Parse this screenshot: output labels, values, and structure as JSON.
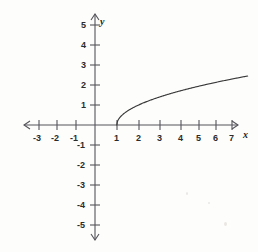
{
  "figure": {
    "kind": "cartesian-graph",
    "background_color": "#fdfdfc",
    "axis_color": "#54545a",
    "curve_color": "#3a3a3a",
    "label_color": "#2b2b2b",
    "x_axis_name": "x",
    "y_axis_name": "y"
  },
  "axes": {
    "x_tick_labels": [
      "-3",
      "-2",
      "-1",
      "1",
      "2",
      "3",
      "4",
      "5",
      "6",
      "7"
    ],
    "y_tick_labels": [
      "5",
      "4",
      "3",
      "2",
      "1",
      "-1",
      "-2",
      "-3",
      "-4",
      "-5"
    ]
  },
  "chart_data": {
    "type": "line",
    "title": "",
    "xlabel": "x",
    "ylabel": "y",
    "xlim": [
      -3.6,
      7.6
    ],
    "ylim": [
      -5.6,
      5.6
    ],
    "xticks": [
      -3,
      -2,
      -1,
      1,
      2,
      3,
      4,
      5,
      6,
      7
    ],
    "yticks": [
      5,
      4,
      3,
      2,
      1,
      -1,
      -2,
      -3,
      -4,
      -5
    ],
    "grid": false,
    "legend": null,
    "series": [
      {
        "name": "y = sqrt(x - 1)",
        "equation": "y = √(x − 1)",
        "domain": [
          1,
          7
        ],
        "x": [
          1,
          1.25,
          1.5,
          1.75,
          2,
          2.5,
          3,
          3.5,
          4,
          4.5,
          5,
          5.5,
          6,
          6.5,
          7
        ],
        "y": [
          0,
          0.5,
          0.71,
          0.87,
          1,
          1.22,
          1.41,
          1.58,
          1.73,
          1.87,
          2,
          2.12,
          2.24,
          2.35,
          2.45
        ]
      }
    ]
  }
}
